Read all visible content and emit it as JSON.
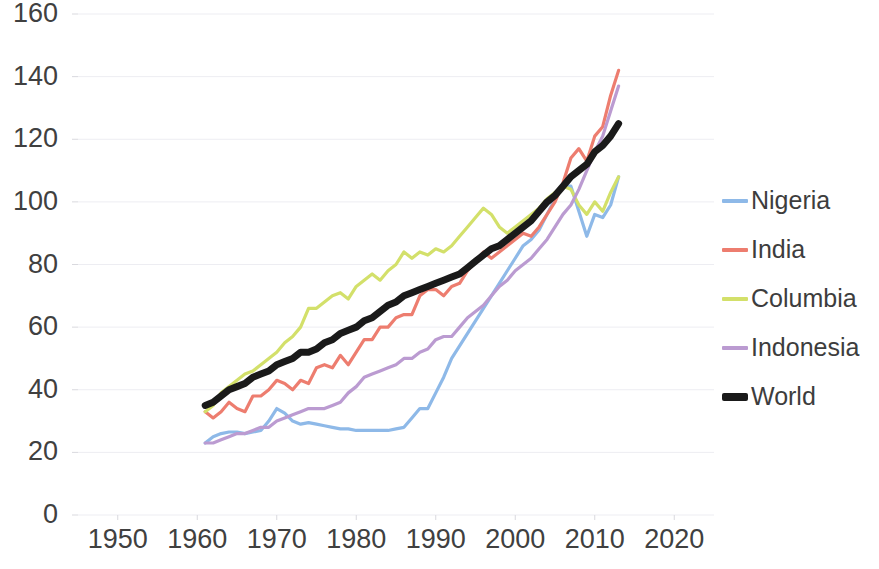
{
  "chart_data": {
    "type": "line",
    "title": "",
    "subtitle": "",
    "xlabel": "",
    "ylabel": "",
    "xlim": [
      1945,
      2025
    ],
    "ylim": [
      0,
      160
    ],
    "x_ticks": [
      1950,
      1960,
      1970,
      1980,
      1990,
      2000,
      2010,
      2020
    ],
    "y_ticks": [
      0,
      20,
      40,
      60,
      80,
      100,
      120,
      140,
      160
    ],
    "grid": "horizontal",
    "legend_position": "right",
    "colors": {
      "Nigeria": "#8eb9e8",
      "India": "#ed7d6f",
      "Columbia": "#d3e06a",
      "Indonesia": "#bb9bd1",
      "World": "#1a1a1a"
    },
    "series": [
      {
        "name": "Nigeria",
        "color": "#8eb9e8",
        "x": [
          1961,
          1962,
          1963,
          1964,
          1965,
          1966,
          1967,
          1968,
          1969,
          1970,
          1971,
          1972,
          1973,
          1974,
          1975,
          1976,
          1977,
          1978,
          1979,
          1980,
          1981,
          1982,
          1983,
          1984,
          1985,
          1986,
          1987,
          1988,
          1989,
          1990,
          1991,
          1992,
          1993,
          1994,
          1995,
          1996,
          1997,
          1998,
          1999,
          2000,
          2001,
          2002,
          2003,
          2004,
          2005,
          2006,
          2007,
          2008,
          2009,
          2010,
          2011,
          2012,
          2013
        ],
        "values": [
          23,
          25,
          26,
          26.5,
          26.5,
          26,
          26.5,
          27,
          30,
          34,
          32.5,
          30,
          29,
          29.5,
          29,
          28.5,
          28,
          27.5,
          27.5,
          27,
          27,
          27,
          27,
          27,
          27.5,
          28,
          31,
          34,
          34,
          39,
          44,
          50,
          54,
          58,
          62,
          66,
          70,
          74,
          78,
          82,
          86,
          88,
          91,
          96,
          101,
          105,
          105,
          97,
          89,
          96,
          95,
          99,
          108
        ]
      },
      {
        "name": "India",
        "color": "#ed7d6f",
        "x": [
          1961,
          1962,
          1963,
          1964,
          1965,
          1966,
          1967,
          1968,
          1969,
          1970,
          1971,
          1972,
          1973,
          1974,
          1975,
          1976,
          1977,
          1978,
          1979,
          1980,
          1981,
          1982,
          1983,
          1984,
          1985,
          1986,
          1987,
          1988,
          1989,
          1990,
          1991,
          1992,
          1993,
          1994,
          1995,
          1996,
          1997,
          1998,
          1999,
          2000,
          2001,
          2002,
          2003,
          2004,
          2005,
          2006,
          2007,
          2008,
          2009,
          2010,
          2011,
          2012,
          2013
        ],
        "values": [
          33,
          31,
          33,
          36,
          34,
          33,
          38,
          38,
          40,
          43,
          42,
          40,
          43,
          42,
          47,
          48,
          47,
          51,
          48,
          52,
          56,
          56,
          60,
          60,
          63,
          64,
          64,
          70,
          72,
          72,
          70,
          73,
          74,
          78,
          81,
          84,
          82,
          84,
          86,
          88,
          90,
          89,
          92,
          96,
          100,
          106,
          114,
          117,
          113,
          121,
          124,
          134,
          142
        ]
      },
      {
        "name": "Columbia",
        "color": "#d3e06a",
        "x": [
          1961,
          1962,
          1963,
          1964,
          1965,
          1966,
          1967,
          1968,
          1969,
          1970,
          1971,
          1972,
          1973,
          1974,
          1975,
          1976,
          1977,
          1978,
          1979,
          1980,
          1981,
          1982,
          1983,
          1984,
          1985,
          1986,
          1987,
          1988,
          1989,
          1990,
          1991,
          1992,
          1993,
          1994,
          1995,
          1996,
          1997,
          1998,
          1999,
          2000,
          2001,
          2002,
          2003,
          2004,
          2005,
          2006,
          2007,
          2008,
          2009,
          2010,
          2011,
          2012,
          2013
        ],
        "values": [
          33,
          35,
          39,
          41,
          43,
          45,
          46,
          48,
          50,
          52,
          55,
          57,
          60,
          66,
          66,
          68,
          70,
          71,
          69,
          73,
          75,
          77,
          75,
          78,
          80,
          84,
          82,
          84,
          83,
          85,
          84,
          86,
          89,
          92,
          95,
          98,
          96,
          92,
          90,
          92,
          94,
          96,
          98,
          101,
          103,
          105,
          104,
          99,
          96,
          100,
          97,
          103,
          108
        ]
      },
      {
        "name": "Indonesia",
        "color": "#bb9bd1",
        "x": [
          1961,
          1962,
          1963,
          1964,
          1965,
          1966,
          1967,
          1968,
          1969,
          1970,
          1971,
          1972,
          1973,
          1974,
          1975,
          1976,
          1977,
          1978,
          1979,
          1980,
          1981,
          1982,
          1983,
          1984,
          1985,
          1986,
          1987,
          1988,
          1989,
          1990,
          1991,
          1992,
          1993,
          1994,
          1995,
          1996,
          1997,
          1998,
          1999,
          2000,
          2001,
          2002,
          2003,
          2004,
          2005,
          2006,
          2007,
          2008,
          2009,
          2010,
          2011,
          2012,
          2013
        ],
        "values": [
          23,
          23,
          24,
          25,
          26,
          26,
          27,
          28,
          28,
          30,
          31,
          32,
          33,
          34,
          34,
          34,
          35,
          36,
          39,
          41,
          44,
          45,
          46,
          47,
          48,
          50,
          50,
          52,
          53,
          56,
          57,
          57,
          60,
          63,
          65,
          67,
          70,
          73,
          75,
          78,
          80,
          82,
          85,
          88,
          92,
          96,
          99,
          104,
          110,
          116,
          121,
          129,
          137
        ]
      },
      {
        "name": "World",
        "color": "#1a1a1a",
        "x": [
          1961,
          1962,
          1963,
          1964,
          1965,
          1966,
          1967,
          1968,
          1969,
          1970,
          1971,
          1972,
          1973,
          1974,
          1975,
          1976,
          1977,
          1978,
          1979,
          1980,
          1981,
          1982,
          1983,
          1984,
          1985,
          1986,
          1987,
          1988,
          1989,
          1990,
          1991,
          1992,
          1993,
          1994,
          1995,
          1996,
          1997,
          1998,
          1999,
          2000,
          2001,
          2002,
          2003,
          2004,
          2005,
          2006,
          2007,
          2008,
          2009,
          2010,
          2011,
          2012,
          2013
        ],
        "values": [
          35,
          36,
          38,
          40,
          41,
          42,
          44,
          45,
          46,
          48,
          49,
          50,
          52,
          52,
          53,
          55,
          56,
          58,
          59,
          60,
          62,
          63,
          65,
          67,
          68,
          70,
          71,
          72,
          73,
          74,
          75,
          76,
          77,
          79,
          81,
          83,
          85,
          86,
          88,
          90,
          92,
          94,
          97,
          100,
          102,
          105,
          108,
          110,
          112,
          116,
          118,
          121,
          125
        ]
      }
    ]
  },
  "axis": {
    "y_tick_labels": [
      "160",
      "140",
      "120",
      "100",
      "80",
      "60",
      "40",
      "20",
      "0"
    ],
    "x_tick_labels": [
      "1950",
      "1960",
      "1970",
      "1980",
      "1990",
      "2000",
      "2010",
      "2020"
    ]
  },
  "legend": {
    "items": [
      {
        "label": "Nigeria",
        "color": "#8eb9e8",
        "thick": false
      },
      {
        "label": "India",
        "color": "#ed7d6f",
        "thick": false
      },
      {
        "label": "Columbia",
        "color": "#d3e06a",
        "thick": false
      },
      {
        "label": "Indonesia",
        "color": "#bb9bd1",
        "thick": false
      },
      {
        "label": "World",
        "color": "#1a1a1a",
        "thick": true
      }
    ]
  }
}
